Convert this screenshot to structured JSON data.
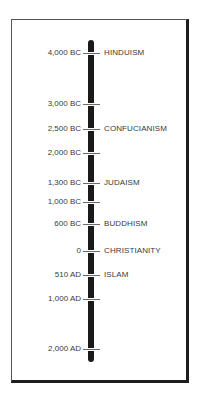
{
  "timeline": {
    "title": "",
    "colors": {
      "bar": "#1a1a1a",
      "text": "#3a3a3a",
      "tick": "#6a6a6a",
      "frame": "#1e1e1e"
    },
    "entries": [
      {
        "date": "4,000 BC",
        "religion": "HINDUISM",
        "y": 53
      },
      {
        "date": "3,000 BC",
        "religion": "",
        "y": 104
      },
      {
        "date": "2,500 BC",
        "religion": "CONFUCIANISM",
        "y": 129
      },
      {
        "date": "2,000 BC",
        "religion": "",
        "y": 153
      },
      {
        "date": "1,300 BC",
        "religion": "JUDAISM",
        "y": 183
      },
      {
        "date": "1,000 BC",
        "religion": "",
        "y": 202
      },
      {
        "date": "600 BC",
        "religion": "BUDDHISM",
        "y": 224
      },
      {
        "date": "0",
        "religion": "CHRISTIANITY",
        "y": 251
      },
      {
        "date": "510 AD",
        "religion": "ISLAM",
        "y": 275
      },
      {
        "date": "1,000 AD",
        "religion": "",
        "y": 299
      },
      {
        "date": "2,000 AD",
        "religion": "",
        "y": 349
      }
    ]
  }
}
